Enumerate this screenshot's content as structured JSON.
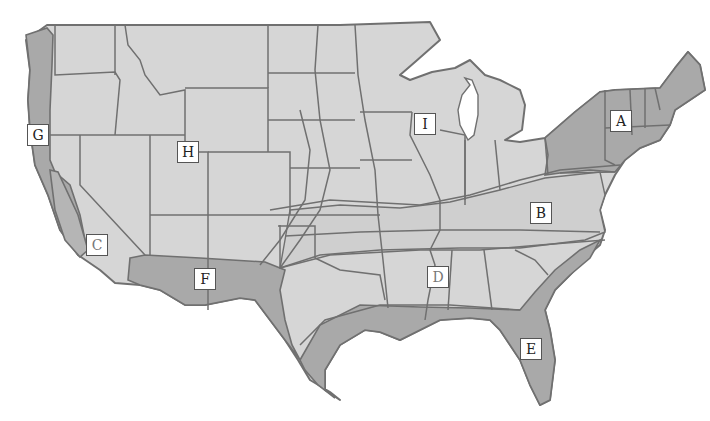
{
  "map": {
    "title": "Contiguous United States climate/region zones",
    "colors": {
      "background": "#ffffff",
      "base_region": "#d6d6d6",
      "shaded_region": "#a9a9a9",
      "medium_region": "#c4c4c4",
      "border": "#707070",
      "label_bg": "#ffffff",
      "label_border": "#555555"
    },
    "labels": [
      {
        "id": "A",
        "text": "A",
        "x": 610,
        "y": 110,
        "region": "Northeast (shaded)"
      },
      {
        "id": "B",
        "text": "B",
        "x": 530,
        "y": 202,
        "region": "Mid-Atlantic / Upper South band"
      },
      {
        "id": "C",
        "text": "C",
        "x": 86,
        "y": 234,
        "region": "Southern California interior"
      },
      {
        "id": "D",
        "text": "D",
        "x": 427,
        "y": 266,
        "region": "Deep South"
      },
      {
        "id": "E",
        "text": "E",
        "x": 520,
        "y": 338,
        "region": "Gulf Coast / Florida (shaded)"
      },
      {
        "id": "F",
        "text": "F",
        "x": 194,
        "y": 268,
        "region": "Desert Southwest (shaded)"
      },
      {
        "id": "G",
        "text": "G",
        "x": 27,
        "y": 124,
        "region": "Pacific Coast (shaded)"
      },
      {
        "id": "H",
        "text": "H",
        "x": 177,
        "y": 141,
        "region": "Intermountain West"
      },
      {
        "id": "I",
        "text": "I",
        "x": 414,
        "y": 113,
        "region": "Upper Midwest"
      }
    ]
  }
}
